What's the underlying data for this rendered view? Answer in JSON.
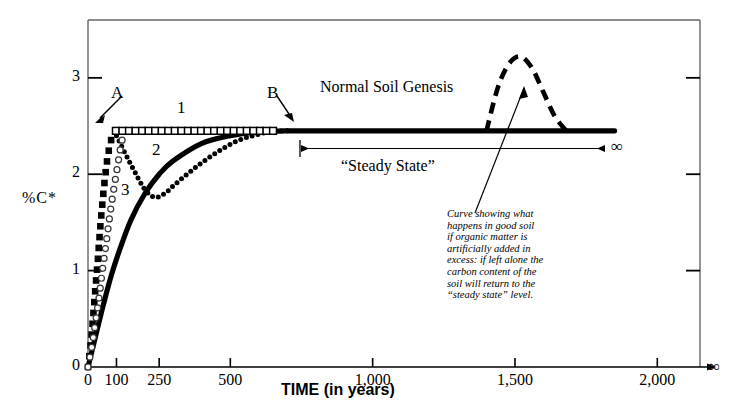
{
  "chart_data": {
    "type": "line",
    "title": "",
    "xlabel": "TIME (in years)",
    "ylabel": "%C*",
    "xlim": [
      0,
      2150
    ],
    "ylim": [
      0,
      3.6
    ],
    "xticks": [
      "0",
      "100",
      "250",
      "500",
      "1,000",
      "1,500",
      "2,000"
    ],
    "xtick_values": [
      0,
      100,
      250,
      500,
      1000,
      1500,
      2000
    ],
    "x_axis_end_symbol": "∞",
    "yticks": [
      "0",
      "1",
      "2",
      "3"
    ],
    "ytick_values": [
      0,
      1,
      2,
      3
    ],
    "grid": false,
    "legend_position": "inline-annotations",
    "steady_state_level": 2.45,
    "series": [
      {
        "name": "B",
        "label": "B",
        "style": "solid-thick",
        "description": "Normal soil genesis curve: asymptotic rise to steady state",
        "x": [
          0,
          25,
          50,
          75,
          100,
          150,
          200,
          250,
          300,
          400,
          500,
          600,
          700,
          900,
          1200,
          1500,
          1850
        ],
        "y": [
          0.0,
          0.3,
          0.6,
          0.88,
          1.12,
          1.52,
          1.8,
          2.0,
          2.14,
          2.32,
          2.4,
          2.44,
          2.45,
          2.45,
          2.45,
          2.45,
          2.45
        ]
      },
      {
        "name": "A",
        "label": "A",
        "style": "filled-squares",
        "description": "Very rapid carbon accumulation reaching steady state almost immediately",
        "x": [
          0,
          10,
          18,
          25,
          32,
          38,
          44,
          50,
          56,
          62,
          68,
          74,
          80,
          86,
          92,
          98
        ],
        "y": [
          0.0,
          0.25,
          0.52,
          0.78,
          1.02,
          1.25,
          1.48,
          1.68,
          1.86,
          2.02,
          2.16,
          2.26,
          2.34,
          2.4,
          2.44,
          2.45
        ]
      },
      {
        "name": "1",
        "label": "1",
        "style": "open-squares",
        "description": "Carbon stays flat at the steady state level after rapid rise",
        "x": [
          98,
          150,
          200,
          250,
          300,
          350,
          400,
          450,
          500,
          550,
          600,
          650
        ],
        "y": [
          2.45,
          2.45,
          2.45,
          2.45,
          2.45,
          2.45,
          2.45,
          2.45,
          2.45,
          2.45,
          2.45,
          2.45
        ]
      },
      {
        "name": "2",
        "label": "2",
        "style": "dotted",
        "description": "Carbon drops after rapid rise, reaches a minimum, then recovers to join the normal curve",
        "x": [
          100,
          130,
          165,
          200,
          235,
          270,
          300,
          340,
          400,
          460,
          520,
          580,
          640,
          700
        ],
        "y": [
          2.4,
          2.22,
          2.02,
          1.84,
          1.76,
          1.8,
          1.88,
          1.98,
          2.12,
          2.24,
          2.34,
          2.4,
          2.44,
          2.45
        ]
      },
      {
        "name": "3",
        "label": "3",
        "style": "open-circles",
        "description": "Slower rise than A, tracking just behind it",
        "x": [
          0,
          14,
          26,
          38,
          48,
          58,
          68,
          78,
          88,
          98,
          108,
          116,
          124,
          132
        ],
        "y": [
          0.0,
          0.22,
          0.46,
          0.7,
          0.94,
          1.16,
          1.38,
          1.6,
          1.8,
          1.98,
          2.16,
          2.3,
          2.4,
          2.45
        ]
      },
      {
        "name": "excess-organic-matter",
        "label": "",
        "style": "dashed-thick",
        "description": "Bump above steady state after artificial organic matter addition, returning to steady state",
        "x": [
          1400,
          1440,
          1480,
          1520,
          1560,
          1600,
          1640,
          1680
        ],
        "y": [
          2.45,
          2.9,
          3.15,
          3.22,
          3.1,
          2.85,
          2.6,
          2.45
        ]
      }
    ],
    "annotations": [
      {
        "name": "normal-soil-genesis",
        "text": "Normal Soil Genesis",
        "x": 880,
        "y": 2.85
      },
      {
        "name": "steady-state",
        "text": "“Steady State”",
        "x": 790,
        "y": 2.12
      },
      {
        "name": "steady-state-arrow",
        "text": "",
        "from_x": 620,
        "to_x": 1860,
        "y": 2.23,
        "end_symbol": "∞"
      },
      {
        "name": "curve-description",
        "text": "Curve showing what happens in good soil if organic matter is artificially added in excess: if left alone the carbon content of the soil will return to the “steady state” level."
      }
    ]
  },
  "labels": {
    "y_axis": "%C*",
    "x_axis": "TIME (in years)",
    "point_a": "A",
    "point_b": "B",
    "curve_1": "1",
    "curve_2": "2",
    "curve_3": "3",
    "normal_soil_genesis": "Normal Soil Genesis",
    "steady_state": "“Steady State”",
    "infinity_axis": "∞",
    "infinity_steady": "∞",
    "annotation_lines": [
      "Curve showing what",
      "happens in good soil",
      "if organic matter is",
      "artificially added in",
      "excess: if left alone the",
      "carbon content of the",
      "soil will return to the",
      "“steady state” level."
    ]
  },
  "xtick_labels": [
    "0",
    "100",
    "250",
    "500",
    "1,000",
    "1,500",
    "2,000"
  ],
  "ytick_labels": [
    "3",
    "2",
    "1",
    "0"
  ],
  "colors": {
    "ink": "#000000",
    "frame": "#555555",
    "background": "#ffffff"
  }
}
